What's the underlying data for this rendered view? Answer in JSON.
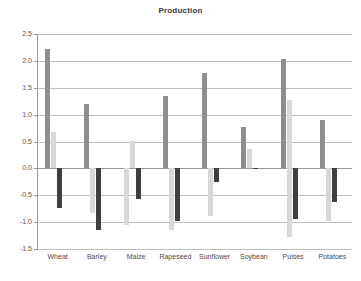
{
  "chart_data": {
    "type": "bar",
    "title": "Production",
    "xlabel": "",
    "ylabel": "",
    "ylim": [
      -1.5,
      2.5
    ],
    "ytick_step": 0.5,
    "ytick_labels": [
      "2.5",
      "2.0",
      "1.5",
      "1.0",
      "0.5",
      "0.0",
      "-0.5",
      "-1.0",
      "-1.5"
    ],
    "ytick_values": [
      2.5,
      2.0,
      1.5,
      1.0,
      0.5,
      0.0,
      -0.5,
      -1.0,
      -1.5
    ],
    "grid": true,
    "legend": "none",
    "orientation": "vertical",
    "grouping": "clustered",
    "categories": [
      "Wheat",
      "Barley",
      "Maize",
      "Rapeseed",
      "Sunflower",
      "Soybean",
      "Pulses",
      "Potatoes"
    ],
    "series": [
      {
        "name": "Series 1",
        "color": "#8e8e8e",
        "values": [
          2.22,
          1.19,
          0.0,
          1.34,
          1.78,
          0.77,
          2.03,
          0.9
        ]
      },
      {
        "name": "Series 2",
        "color": "#d8d8d8",
        "values": [
          0.68,
          -0.83,
          0.51,
          -1.15,
          -0.88,
          0.36,
          1.28,
          -0.97
        ]
      },
      {
        "name": "Series 3",
        "color": "#3f3f3f",
        "values": [
          -0.73,
          -1.15,
          -0.57,
          -0.97,
          -0.25,
          -0.02,
          -0.95,
          -0.63
        ]
      }
    ],
    "extra_bars": [
      {
        "category": "Maize",
        "series": "Series 1",
        "value": -1.05,
        "color": "#d8d8d8"
      },
      {
        "category": "Rapeseed",
        "series": "Series 2",
        "value": -1.15,
        "color": "#d8d8d8"
      },
      {
        "category": "Pulses",
        "series": "Series 2",
        "value": -1.27,
        "color": "#d8d8d8"
      }
    ]
  },
  "axis": {
    "y_labels": [
      "2.5",
      "2.0",
      "1.5",
      "1.0",
      "0.5",
      "0.0",
      "-0.5",
      "-1.0",
      "-1.5"
    ],
    "x_labels": [
      "Wheat",
      "Barley",
      "Maize",
      "Rapeseed",
      "Sunflower",
      "Soybean",
      "Pulses",
      "Potatoes"
    ]
  }
}
